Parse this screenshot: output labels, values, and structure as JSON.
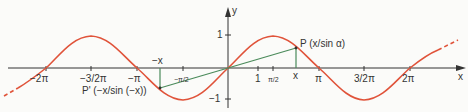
{
  "figure": {
    "axes": {
      "x_label": "x",
      "y_label": "y",
      "x_ticks": [
        "−2π",
        "−3/2π",
        "−π",
        "−π/2",
        "1",
        "π/2",
        "π",
        "3/2π",
        "2π"
      ],
      "y_ticks": [
        "1",
        "−1"
      ]
    },
    "annotations": {
      "point_p": "P (x/sin α)",
      "point_p_prime": "P' (−x/sin (−x))",
      "x_marker": "x",
      "neg_x_marker": "−x"
    },
    "colors": {
      "curve": "#e0533a",
      "segment": "#4a8a5a",
      "axis": "#333333"
    }
  }
}
